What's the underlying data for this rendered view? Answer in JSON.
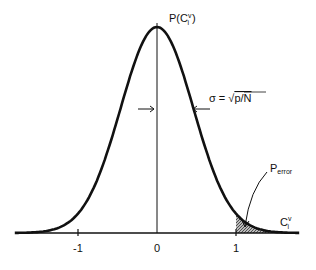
{
  "chart_data": {
    "type": "line",
    "title": "",
    "ylabel": "P(C",
    "ylabel_sup": "v",
    "ylabel_sub": "i",
    "ylabel_close": ")",
    "xlabel": "C",
    "xlabel_sup": "v",
    "xlabel_sub": "i",
    "x_ticks": [
      "-1",
      "0",
      "1"
    ],
    "x_tick_values": [
      -1,
      0,
      1
    ],
    "xlim": [
      -1.8,
      1.8
    ],
    "mean": 0,
    "sigma_value": 0.46,
    "annotations": {
      "sigma_label": "σ = ",
      "sigma_sqrt": "√",
      "sigma_expr": "p/N",
      "error_label": "P",
      "error_sub": "error"
    },
    "shaded_region": {
      "from": 1,
      "to": 1.8,
      "label": "P_error"
    }
  }
}
